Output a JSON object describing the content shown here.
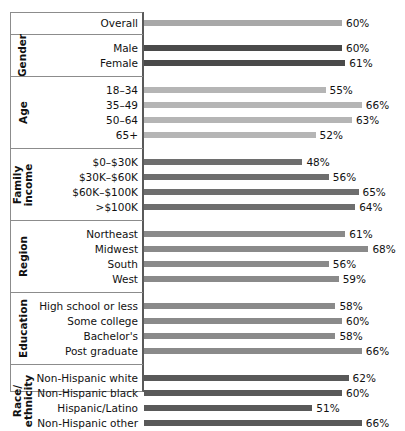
{
  "chart_data": {
    "type": "bar",
    "title": "",
    "subtitle": "",
    "xlabel": "",
    "ylabel": "",
    "xlim": [
      0,
      75
    ],
    "grid": false,
    "legend": "none",
    "orientation": "horizontal",
    "value_suffix": "%",
    "axis_origin_percent": 0,
    "groups": [
      {
        "name": "",
        "color": "#a8a8a8",
        "categories": [
          "Overall"
        ],
        "values": [
          60
        ],
        "labels": [
          "60%"
        ]
      },
      {
        "name": "Gender",
        "color": "#4a4a4a",
        "categories": [
          "Male",
          "Female"
        ],
        "values": [
          60,
          61
        ],
        "labels": [
          "60%",
          "61%"
        ]
      },
      {
        "name": "Age",
        "color": "#b5b5b5",
        "categories": [
          "18–34",
          "35–49",
          "50–64",
          "65+"
        ],
        "values": [
          55,
          66,
          63,
          52
        ],
        "labels": [
          "55%",
          "66%",
          "63%",
          "52%"
        ]
      },
      {
        "name": "Family income",
        "color": "#6e6e6e",
        "categories": [
          "$0–$30K",
          "$30K–$60K",
          "$60K–$100K",
          ">$100K"
        ],
        "values": [
          48,
          56,
          65,
          64
        ],
        "labels": [
          "48%",
          "56%",
          "65%",
          "64%"
        ]
      },
      {
        "name": "Region",
        "color": "#8a8a8a",
        "categories": [
          "Northeast",
          "Midwest",
          "South",
          "West"
        ],
        "values": [
          61,
          68,
          56,
          59
        ],
        "labels": [
          "61%",
          "68%",
          "56%",
          "59%"
        ]
      },
      {
        "name": "Education",
        "color": "#8a8a8a",
        "categories": [
          "High school or less",
          "Some college",
          "Bachelor's",
          "Post graduate"
        ],
        "values": [
          58,
          60,
          58,
          66
        ],
        "labels": [
          "58%",
          "60%",
          "58%",
          "66%"
        ]
      },
      {
        "name": "Race/ ethnicity",
        "color": "#595959",
        "categories": [
          "Non-Hispanic white",
          "Non-Hispanic black",
          "Hispanic/Latino",
          "Non-Hispanic other"
        ],
        "values": [
          62,
          60,
          51,
          66
        ],
        "labels": [
          "62%",
          "60%",
          "51%",
          "66%"
        ]
      }
    ]
  }
}
